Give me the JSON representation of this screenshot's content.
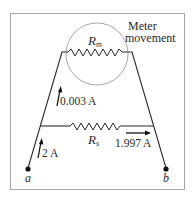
{
  "diagram": {
    "labels": {
      "meter_line1": "Meter",
      "meter_line2": "movement",
      "rm_main": "R",
      "rm_sub": "m",
      "rs_main": "R",
      "rs_sub": "s",
      "current_meter": "0.003 A",
      "current_total": "2 A",
      "current_shunt": "1.997 A",
      "terminal_a": "a",
      "terminal_b": "b"
    },
    "colors": {
      "wire": "#2a2a2a",
      "circle": "#a0a0a0",
      "frame": "#9a9a9a",
      "background": "#ffffff"
    }
  }
}
